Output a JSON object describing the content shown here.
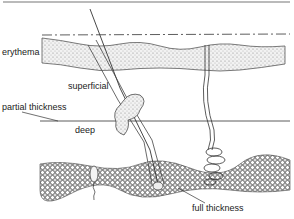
{
  "figure": {
    "type": "skin cross-section diagram (burn depth)",
    "labels": {
      "erythema": "erythema",
      "superficial": "superficial",
      "partial_thickness": "partial thickness",
      "deep": "deep",
      "full_thickness": "full thickness"
    },
    "structures": [
      "epidermis",
      "dermis",
      "hair follicle",
      "sebaceous gland",
      "sweat gland",
      "subcutaneous fat"
    ],
    "colors": {
      "line": "#333333",
      "stipple": "#888888",
      "fat": "#555555",
      "border": "#777777"
    }
  }
}
